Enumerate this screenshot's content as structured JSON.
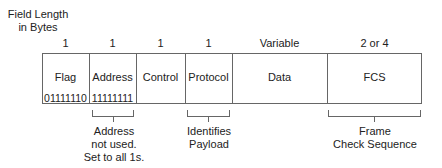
{
  "title_line1": "Field Length",
  "title_line2": "in Bytes",
  "fields": [
    {
      "name": "Flag",
      "length": "1",
      "value": "01111110"
    },
    {
      "name": "Address",
      "length": "1",
      "value": "11111111"
    },
    {
      "name": "Control",
      "length": "1"
    },
    {
      "name": "Protocol",
      "length": "1"
    },
    {
      "name": "Data",
      "length": "Variable"
    },
    {
      "name": "FCS",
      "length": "2 or 4"
    }
  ],
  "notes": {
    "address": [
      "Address",
      "not used.",
      "Set to all 1s."
    ],
    "protocol": [
      "Identifies",
      "Payload"
    ],
    "fcs": [
      "Frame",
      "Check Sequence"
    ]
  }
}
